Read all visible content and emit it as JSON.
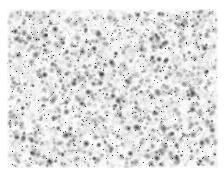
{
  "figure": {
    "kind": "micrograph",
    "title": "Grayscale speckle micrograph",
    "modality": "brightfield light microscopy",
    "canvas": {
      "width_px": 224,
      "height_px": 176,
      "background_color": "#ffffff"
    },
    "panel": {
      "left_px": 7,
      "top_px": 9,
      "width_px": 211,
      "height_px": 159,
      "base_color": "#fdfdfd",
      "border": "none"
    },
    "appearance": {
      "background_tone": "#fbfbfb",
      "mid_tone": "#c8c8c8",
      "dark_tone": "#6a6a6a",
      "darkest_tone": "#303030",
      "has_color": false,
      "has_axes": false,
      "has_gridlines": false,
      "has_scalebar": false,
      "has_labels": false,
      "has_legend": false,
      "has_annotations": false
    },
    "texture": {
      "description": "dense random stipple of small dark puncta with soft gray halos on a near-white field",
      "seed": 20240917,
      "speckle_count": 2600,
      "halo_count": 900,
      "smudge_count": 170,
      "speckle_radius_min_px": 0.5,
      "speckle_radius_max_px": 2.1,
      "halo_radius_min_px": 2.0,
      "halo_radius_max_px": 5.5,
      "density_uniform": true,
      "edge_fade_px": 3
    }
  },
  "chart_data": {
    "type": "heatmap",
    "title": "Grayscale speckle micrograph",
    "xlabel": "",
    "ylabel": "",
    "categories": [],
    "values": []
  }
}
